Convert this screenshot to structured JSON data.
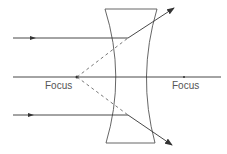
{
  "diagram": {
    "type": "concave-lens-ray-diagram",
    "labels": {
      "left_focus": "Focus",
      "right_focus": "Focus"
    },
    "colors": {
      "line": "#333333",
      "lens": "#555555",
      "label": "#555555",
      "background": "#ffffff"
    },
    "elements": {
      "lens": "diverging (concave) lens",
      "rays": [
        "upper parallel ray",
        "principal axis",
        "lower parallel ray"
      ],
      "virtual_rays": [
        "dashed line from left focus to upper refraction point",
        "dashed line from left focus to lower refraction point"
      ]
    }
  }
}
